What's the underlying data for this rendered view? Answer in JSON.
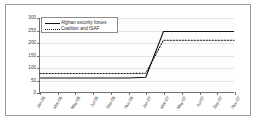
{
  "chart_data": {
    "type": "line",
    "title": "",
    "xlabel": "",
    "ylabel": "",
    "ylim": [
      0,
      300
    ],
    "yticks": [
      0,
      50,
      100,
      150,
      200,
      250,
      300
    ],
    "grid": true,
    "legend_position": "top-left",
    "categories": [
      "Jan-06",
      "Mar-06",
      "May-06",
      "Jul-06",
      "Sep-06",
      "Nov-06",
      "Jan-07",
      "Mar-07",
      "May-07",
      "Jul-07",
      "Sep-07",
      "Nov-07"
    ],
    "series": [
      {
        "name": "Afghan security forces",
        "style": "solid",
        "color": "#111111",
        "values": [
          57,
          57,
          57,
          57,
          57,
          57,
          60,
          245,
          245,
          245,
          245,
          245
        ]
      },
      {
        "name": "Coalition and ISAF",
        "style": "dotted",
        "color": "#111111",
        "values": [
          75,
          75,
          75,
          75,
          75,
          75,
          76,
          210,
          210,
          210,
          210,
          210
        ]
      }
    ]
  },
  "legend": {
    "entries": [
      {
        "label": "Afghan security forces",
        "style": "solid"
      },
      {
        "label": "Coalition and ISAF",
        "style": "dotted"
      }
    ]
  },
  "axis": {
    "y_tick_labels": [
      "300",
      "250",
      "200",
      "150",
      "100",
      "50",
      "0"
    ],
    "x_tick_labels": [
      "Jan-06",
      "Mar-06",
      "May-06",
      "Jul-06",
      "Sep-06",
      "Nov-06",
      "Jan-07",
      "Mar-07",
      "May-07",
      "Jul-07",
      "Sep-07",
      "Nov-07"
    ]
  },
  "colors": {
    "frame": "#9a9a9a",
    "axis": "#6d6d6d",
    "grid": "#e3e3e3",
    "line": "#111111",
    "background": "#ffffff"
  }
}
